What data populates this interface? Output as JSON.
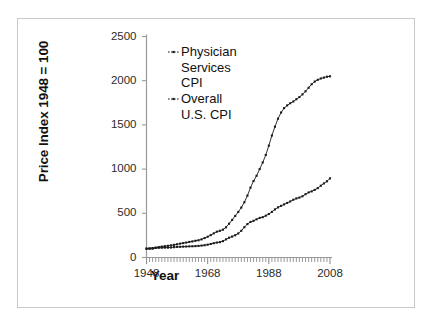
{
  "chart_data": {
    "type": "line",
    "title": "",
    "xlabel": "Year",
    "ylabel": "Price Index 1948 = 100",
    "xlim": [
      1948,
      2008
    ],
    "ylim": [
      0,
      2500
    ],
    "ytick_labels": [
      "0",
      "500",
      "1000",
      "1500",
      "2000",
      "2500"
    ],
    "yticks": [
      0,
      500,
      1000,
      1500,
      2000,
      2500
    ],
    "xtick_labels": [
      "1948",
      "1968",
      "1988",
      "2008"
    ],
    "xticks": [
      1948,
      1968,
      1988,
      2008
    ],
    "grid": false,
    "legend_position": "upper-left-inside",
    "minor_xticks": "annual",
    "x": [
      1948,
      1949,
      1950,
      1951,
      1952,
      1953,
      1954,
      1955,
      1956,
      1957,
      1958,
      1959,
      1960,
      1961,
      1962,
      1963,
      1964,
      1965,
      1966,
      1967,
      1968,
      1969,
      1970,
      1971,
      1972,
      1973,
      1974,
      1975,
      1976,
      1977,
      1978,
      1979,
      1980,
      1981,
      1982,
      1983,
      1984,
      1985,
      1986,
      1987,
      1988,
      1989,
      1990,
      1991,
      1992,
      1993,
      1994,
      1995,
      1996,
      1997,
      1998,
      1999,
      2000,
      2001,
      2002,
      2003,
      2004,
      2005,
      2006,
      2007,
      2008
    ],
    "series": [
      {
        "name": "Physician Services CPI",
        "label": "Physician\nServices\nCPI",
        "color": "#1a1a1a",
        "marker": "dot",
        "values": [
          100,
          104,
          107,
          112,
          118,
          123,
          128,
          132,
          137,
          143,
          150,
          157,
          163,
          169,
          176,
          182,
          189,
          195,
          205,
          220,
          235,
          253,
          273,
          292,
          302,
          315,
          342,
          382,
          425,
          470,
          515,
          565,
          625,
          700,
          790,
          865,
          925,
          1000,
          1075,
          1160,
          1265,
          1380,
          1480,
          1570,
          1640,
          1690,
          1720,
          1745,
          1765,
          1790,
          1815,
          1845,
          1880,
          1920,
          1960,
          1990,
          2010,
          2025,
          2035,
          2045,
          2050
        ]
      },
      {
        "name": "Overall U.S. CPI",
        "label": "Overall\nU.S. CPI",
        "color": "#1a1a1a",
        "marker": "dot",
        "values": [
          100,
          99,
          100,
          108,
          110,
          111,
          112,
          112,
          113,
          117,
          120,
          121,
          123,
          124,
          126,
          127,
          129,
          131,
          135,
          139,
          145,
          153,
          162,
          169,
          174,
          185,
          205,
          224,
          237,
          252,
          272,
          302,
          343,
          378,
          402,
          415,
          432,
          448,
          456,
          473,
          492,
          516,
          544,
          567,
          584,
          601,
          617,
          634,
          653,
          668,
          678,
          693,
          716,
          736,
          748,
          765,
          785,
          812,
          838,
          862,
          895
        ]
      }
    ]
  }
}
